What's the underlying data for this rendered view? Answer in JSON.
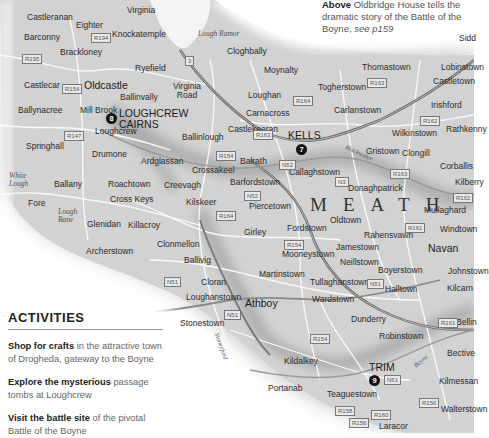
{
  "caption": {
    "bold": "Above",
    "text": "Oldbridge House tells the dramatic story of the Battle of the Boyne,",
    "ref": "see p159"
  },
  "activities": {
    "heading": "ACTIVITIES",
    "items": [
      {
        "bold": "Shop for crafts",
        "text": "in the attractive town of Drogheda, gateway to the Boyne"
      },
      {
        "bold": "Explore the mysterious",
        "text": "passage tombs at Loughcrew"
      },
      {
        "bold": "Visit the battle site",
        "text": "of the pivotal Battle of the Boyne"
      }
    ]
  },
  "map": {
    "county": "MEATH",
    "sites": [
      {
        "num": "8",
        "name1": "LOUGHCREW",
        "name2": "CAIRNS"
      },
      {
        "num": "7",
        "name": "KELLS"
      },
      {
        "num": "9",
        "name": "TRIM"
      }
    ],
    "water": [
      "Lough Ramor",
      "White Lough",
      "Lough Bane"
    ],
    "rivers": [
      "Blackwater",
      "Stoneyford",
      "Boyne"
    ],
    "places": {
      "castleranan": "Castleranan",
      "eighter": "Eighter",
      "virginia": "Virginia",
      "barconny": "Barconny",
      "knockatemple": "Knockatemple",
      "brackloney": "Brackloney",
      "ryefield": "Ryefield",
      "cloghbally": "Cloghbally",
      "castlecar": "Castlecar",
      "oldcastle": "Oldcastle",
      "ballinvally": "Ballinvally",
      "virginia_road": "Virginia Road",
      "moynalty": "Moynalty",
      "thomastown": "Thomastown",
      "lobinstown": "Lobinstown",
      "castletown": "Castletown",
      "togherstown": "Togherstown",
      "carlanstown": "Carlanstown",
      "loughan": "Loughan",
      "carnacross": "Carnacross",
      "ballynacree": "Ballynacree",
      "mill_brook": "Mill Brook",
      "loughcrew": "Loughcrew",
      "castlekeeran": "Castlekeeran",
      "irishford": "Irishford",
      "springhall": "Springhall",
      "ballinlough": "Ballinlough",
      "wilkinstown": "Wilkinstown",
      "rathkenny": "Rathkenny",
      "drumone": "Drumone",
      "ardglassan": "Ardglassan",
      "balrath": "Balrath",
      "girley_crossakeel": "Crossakeel",
      "kells": "Kells",
      "gristown": "Gristown",
      "clongill": "Clongill",
      "corballis": "Corballis",
      "ballany": "Ballany",
      "roachtown": "Roachtown",
      "barfordstown": "Barfordstown",
      "callaghstown": "Callaghstown",
      "kilberry": "Kilberry",
      "fore": "Fore",
      "creevagh": "Creevagh",
      "donaghpatrick": "Donaghpatrick",
      "cross_keys": "Cross Keys",
      "kilskeer": "Kilskeer",
      "piercetown": "Piercetown",
      "mullaghard": "Mullaghard",
      "glenidan": "Glenidan",
      "killacroy": "Killacroy",
      "oldtown": "Oldtown",
      "windtown": "Windtown",
      "girley": "Girley",
      "fordstown": "Fordstown",
      "rahensvawn": "Rahensvawn",
      "navan": "Navan",
      "archerstown": "Archerstown",
      "clonmellon": "Clonmellon",
      "jamestown": "Jamestown",
      "johnstown": "Johnstown",
      "mooneystown": "Mooneystown",
      "neillstown": "Neillstown",
      "ballivig": "Ballivig",
      "boyerstown": "Boyerstown",
      "kilcarn": "Kilcarn",
      "martinstown": "Martinstown",
      "cloran": "Cloran",
      "tullaghanstown": "Tullaghanstown",
      "halltown": "Halltown",
      "loughanstown": "Loughanstown",
      "wardstown": "Wardstown",
      "athboy": "Athboy",
      "stonestown": "Stonestown",
      "dunderry": "Dunderry",
      "bellinter": "Bellin",
      "robinstown": "Robinstown",
      "bective": "Bective",
      "kildalkey": "Kildalkey",
      "kilmessan": "Kilmessan",
      "portanab": "Portanab",
      "teaguestown": "Teaguestown",
      "walterstown": "Walterstown",
      "laracor": "Laracor",
      "siddan": "Sidd"
    },
    "roads": [
      "R194",
      "R195",
      "R154",
      "N3",
      "R164",
      "R163",
      "R162",
      "R147",
      "N52",
      "R154b",
      "N51",
      "R161",
      "N51b",
      "R164b",
      "R154c",
      "R161b",
      "R156",
      "R158",
      "R154d",
      "R160",
      "R156b"
    ],
    "road_labels": {
      "r194": "R194",
      "r195": "R195",
      "r154": "R154",
      "n3": "3",
      "r164": "R164",
      "r163": "R163",
      "r162": "R162",
      "r147": "R147",
      "n52": "N52",
      "r154b": "R154",
      "n51": "N51",
      "r164b": "R164",
      "n3b": "N3",
      "r161": "R161",
      "r154c": "R154",
      "r161b": "R161",
      "r156": "R156",
      "r158": "R158",
      "r154d": "R154",
      "r160": "R160",
      "r156b": "R156"
    }
  }
}
